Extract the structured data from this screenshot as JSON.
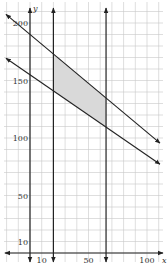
{
  "chart_data": {
    "type": "line",
    "title": "",
    "xlabel": "x",
    "ylabel": "y",
    "x_tick_labels": [
      "10",
      "50",
      "100"
    ],
    "x_ticks": [
      10,
      50,
      100
    ],
    "y_tick_labels": [
      "10",
      "50",
      "100",
      "150",
      "200"
    ],
    "y_ticks": [
      10,
      50,
      100,
      150,
      200
    ],
    "xlim": [
      -20,
      115
    ],
    "ylim": [
      -10,
      215
    ],
    "grid": true,
    "grid_step": 10,
    "series": [
      {
        "name": "upper boundary line",
        "kind": "line",
        "slope": -0.85,
        "intercept": 190
      },
      {
        "name": "lower boundary line",
        "kind": "line",
        "slope": -0.7,
        "intercept": 155
      },
      {
        "name": "vertical line x=20",
        "kind": "vline",
        "x": 20
      },
      {
        "name": "vertical line x=65",
        "kind": "vline",
        "x": 65
      }
    ],
    "shaded_region": {
      "description": "feasible region between the two sloped lines and the vertical lines x=20 and x=65",
      "color": "#d9d9d9"
    },
    "colors": {
      "grid": "#c8c8c8",
      "lines": "#222222",
      "shade": "#d9d9d9"
    }
  }
}
